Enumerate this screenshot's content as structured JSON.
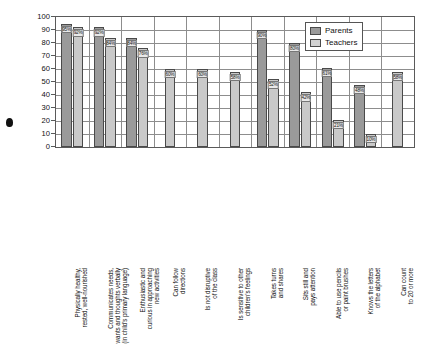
{
  "chart_data": {
    "type": "bar",
    "title": "",
    "xlabel": "",
    "ylabel": "",
    "ylim": [
      0,
      100
    ],
    "yticks": [
      0,
      10,
      20,
      30,
      40,
      50,
      60,
      70,
      80,
      90,
      100
    ],
    "grid": true,
    "legend_position": "top-right",
    "categories": [
      "Physically healthy, rested, well-nourished",
      "Communicates needs, wants and thoughts verbally (in child's primary language)",
      "Enthusiastic and curious in approaching new activities",
      "Can follow directions",
      "Is not disruptive of the class",
      "Is sensitive to other children's feelings",
      "Takes turns and shares",
      "Sits still and pays attention",
      "Able to use pencils or paint brushes",
      "Knows the letters of the alphabet",
      "Can count to 20 or more"
    ],
    "category_lines": [
      [
        "Physically healthy,",
        "rested, well-nourished"
      ],
      [
        "Communicates needs,",
        "wants and thoughts verbally",
        "(in child's primary language)"
      ],
      [
        "Enthusiastic and",
        "curious in approaching",
        "new activities"
      ],
      [
        "Can follow",
        "directions"
      ],
      [
        "Is not disruptive",
        "of the class"
      ],
      [
        "Is sensitive to other",
        "children's feelings"
      ],
      [
        "Takes turns",
        "and shares"
      ],
      [
        "Sits still and",
        "pays attention"
      ],
      [
        "Able to use pencils",
        "or paint brushes"
      ],
      [
        "Knows the letters",
        "of the alphabet"
      ],
      [
        "Can count",
        "to 20 or more"
      ]
    ],
    "series": [
      {
        "name": "Parents",
        "color": "#9a9a9a",
        "values": [
          95,
          92,
          84,
          null,
          null,
          null,
          90,
          80,
          61,
          48,
          null
        ],
        "labels": [
          "95%",
          "92%",
          "84%",
          "",
          "",
          "",
          "90%",
          "80%",
          "61%",
          "48%",
          ""
        ]
      },
      {
        "name": "Teachers",
        "color": "#c9c9c9",
        "values": [
          92,
          84,
          76,
          60,
          60,
          58,
          52,
          42,
          21,
          10,
          58
        ],
        "labels": [
          "92%",
          "84%",
          "76%",
          "60%",
          "60%",
          "58%",
          "52%",
          "42%",
          "21%",
          "10%",
          "58%"
        ]
      }
    ]
  },
  "legend": {
    "items": [
      {
        "label": "Parents",
        "color": "#9a9a9a"
      },
      {
        "label": "Teachers",
        "color": "#d2d2d2"
      }
    ]
  },
  "axis": {
    "y_tick_labels": [
      "100",
      "90",
      "80",
      "70",
      "60",
      "50",
      "40",
      "30",
      "20",
      "10",
      "0"
    ]
  }
}
